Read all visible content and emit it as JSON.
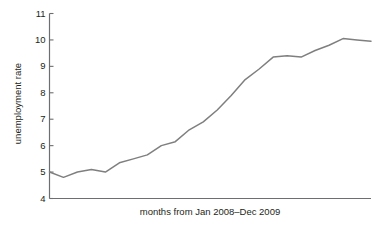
{
  "chart_data": {
    "type": "line",
    "title": "",
    "xlabel": "months from Jan 2008–Dec 2009",
    "ylabel": "unemployment rate",
    "ylim": [
      4,
      11
    ],
    "yticks": [
      4,
      5,
      6,
      7,
      8,
      9,
      10,
      11
    ],
    "ytick_labels": [
      "4",
      "5",
      "6",
      "7",
      "8",
      "9",
      "10",
      "11"
    ],
    "xticks": [],
    "xtick_labels": [],
    "grid": false,
    "legend": false,
    "line_color": "#7f7f7f",
    "axis_color": "#58595b",
    "x": [
      1,
      2,
      3,
      4,
      5,
      6,
      7,
      8,
      9,
      10,
      11,
      12,
      13,
      14,
      15,
      16,
      17,
      18,
      19,
      20,
      21,
      22,
      23,
      24
    ],
    "x_labels": [
      "Jan 2008",
      "Feb 2008",
      "Mar 2008",
      "Apr 2008",
      "May 2008",
      "Jun 2008",
      "Jul 2008",
      "Aug 2008",
      "Sep 2008",
      "Oct 2008",
      "Nov 2008",
      "Dec 2008",
      "Jan 2009",
      "Feb 2009",
      "Mar 2009",
      "Apr 2009",
      "May 2009",
      "Jun 2009",
      "Jul 2009",
      "Aug 2009",
      "Sep 2009",
      "Oct 2009",
      "Nov 2009",
      "Dec 2009"
    ],
    "values": [
      5.0,
      4.8,
      5.0,
      5.1,
      5.0,
      5.35,
      5.5,
      5.65,
      6.0,
      6.15,
      6.6,
      6.9,
      7.35,
      7.9,
      8.5,
      8.9,
      9.35,
      9.4,
      9.35,
      9.6,
      9.8,
      10.05,
      10.0,
      9.95
    ],
    "xlim": [
      1,
      24
    ]
  },
  "axes": {
    "y_title": "unemployment rate",
    "x_title": "months from Jan 2008–Dec 2009"
  }
}
